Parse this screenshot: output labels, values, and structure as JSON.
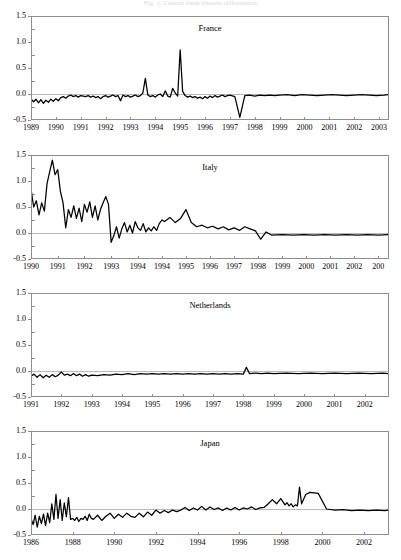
{
  "figure": {
    "caption": "Fig. 1.  Central bank interest differentials",
    "caption_visible": "clipped"
  },
  "chart_data": [
    {
      "type": "line",
      "title": "France",
      "xlabel": "",
      "ylabel": "",
      "ylim": [
        -0.5,
        1.5
      ],
      "yticks": [
        "1.5",
        "1.0",
        "0.5",
        "0.0",
        "-0.5"
      ],
      "ytick_values": [
        1.5,
        1.0,
        0.5,
        0.0,
        -0.5
      ],
      "xlim": [
        1989.0,
        2003.4
      ],
      "xticks": [
        "1989",
        "1990",
        "1991",
        "1992",
        "1993",
        "1994",
        "1995",
        "1996",
        "1997",
        "1998",
        "1999",
        "2000",
        "2001",
        "2002",
        "2003"
      ],
      "xtick_values": [
        1989,
        1990,
        1991,
        1992,
        1993,
        1994,
        1995,
        1996,
        1997,
        1998,
        1999,
        2000,
        2001,
        2002,
        2003
      ],
      "grid": false,
      "legend": "none",
      "zero_reference_line": true,
      "x": [
        1989.0,
        1989.1,
        1989.2,
        1989.3,
        1989.4,
        1989.5,
        1989.6,
        1989.7,
        1989.8,
        1989.9,
        1990.0,
        1990.1,
        1990.2,
        1990.3,
        1990.4,
        1990.5,
        1990.6,
        1990.7,
        1990.8,
        1990.9,
        1991.0,
        1991.1,
        1991.2,
        1991.3,
        1991.4,
        1991.5,
        1991.6,
        1991.7,
        1991.8,
        1991.9,
        1992.0,
        1992.1,
        1992.2,
        1992.3,
        1992.4,
        1992.5,
        1992.6,
        1992.7,
        1992.8,
        1992.9,
        1993.0,
        1993.1,
        1993.2,
        1993.3,
        1993.4,
        1993.5,
        1993.6,
        1993.7,
        1993.8,
        1993.9,
        1994.0,
        1994.1,
        1994.2,
        1994.3,
        1994.4,
        1994.5,
        1994.6,
        1994.7,
        1994.8,
        1994.9,
        1995.0,
        1995.1,
        1995.2,
        1995.3,
        1995.4,
        1995.5,
        1995.6,
        1995.7,
        1995.8,
        1995.9,
        1996.0,
        1996.1,
        1996.2,
        1996.3,
        1996.4,
        1996.5,
        1996.6,
        1996.7,
        1996.8,
        1996.9,
        1997.0,
        1997.2,
        1997.4,
        1997.6,
        1997.8,
        1998.0,
        1998.2,
        1998.4,
        1998.6,
        1998.8,
        1999.0,
        1999.3,
        1999.6,
        1999.9,
        2000.2,
        2000.5,
        2000.8,
        2001.1,
        2001.4,
        2001.7,
        2002.0,
        2002.3,
        2002.6,
        2002.9,
        2003.2,
        2003.4
      ],
      "y": [
        -0.09,
        -0.15,
        -0.1,
        -0.17,
        -0.11,
        -0.18,
        -0.12,
        -0.16,
        -0.1,
        -0.14,
        -0.09,
        -0.13,
        -0.07,
        -0.05,
        -0.08,
        -0.04,
        -0.02,
        -0.05,
        -0.03,
        -0.06,
        -0.03,
        -0.04,
        -0.05,
        -0.03,
        -0.06,
        -0.04,
        -0.07,
        -0.05,
        -0.09,
        -0.05,
        -0.03,
        -0.06,
        -0.04,
        -0.02,
        -0.05,
        -0.03,
        -0.13,
        -0.02,
        -0.05,
        -0.03,
        -0.06,
        -0.04,
        -0.02,
        -0.05,
        -0.03,
        0.02,
        0.3,
        -0.02,
        -0.05,
        -0.03,
        -0.06,
        -0.02,
        0.0,
        -0.05,
        0.06,
        -0.04,
        -0.06,
        0.11,
        0.02,
        -0.04,
        0.85,
        0.05,
        -0.03,
        -0.06,
        -0.04,
        -0.07,
        -0.05,
        -0.08,
        -0.06,
        -0.09,
        -0.05,
        -0.08,
        -0.04,
        -0.07,
        -0.03,
        -0.06,
        -0.04,
        -0.02,
        -0.05,
        -0.03,
        -0.02,
        -0.05,
        -0.45,
        -0.03,
        -0.02,
        -0.04,
        -0.02,
        -0.03,
        -0.02,
        -0.03,
        -0.02,
        -0.01,
        -0.03,
        -0.01,
        -0.02,
        -0.03,
        -0.02,
        -0.01,
        -0.02,
        -0.03,
        -0.02,
        -0.01,
        -0.02,
        -0.03,
        -0.02,
        -0.01,
        -0.02
      ]
    },
    {
      "type": "line",
      "title": "Italy",
      "xlabel": "",
      "ylabel": "",
      "ylim": [
        -0.5,
        1.5
      ],
      "yticks": [
        "1.5",
        "1.0",
        "0.5",
        "0.0",
        "-0.5"
      ],
      "ytick_values": [
        1.5,
        1.0,
        0.5,
        0.0,
        -0.5
      ],
      "xlim": [
        1990.0,
        2003.4
      ],
      "xticks": [
        "1990",
        "1991",
        "1992",
        "1993",
        "1994",
        "1994",
        "1995",
        "1996",
        "1997",
        "1998",
        "1999",
        "2000",
        "2001",
        "2002",
        "200"
      ],
      "xtick_values": [
        1990,
        1991,
        1992,
        1993,
        1994,
        1994.9,
        1995.8,
        1996.7,
        1997.6,
        1998.5,
        1999.4,
        2000.3,
        2001.2,
        2002.1,
        2003.0
      ],
      "grid": false,
      "legend": "none",
      "zero_reference_line": true,
      "x": [
        1990.0,
        1990.1,
        1990.2,
        1990.3,
        1990.4,
        1990.5,
        1990.6,
        1990.7,
        1990.8,
        1990.9,
        1991.0,
        1991.1,
        1991.2,
        1991.3,
        1991.4,
        1991.5,
        1991.6,
        1991.7,
        1991.8,
        1991.9,
        1992.0,
        1992.1,
        1992.2,
        1992.3,
        1992.4,
        1992.5,
        1992.6,
        1992.7,
        1992.8,
        1992.9,
        1993.0,
        1993.1,
        1993.2,
        1993.3,
        1993.4,
        1993.5,
        1993.6,
        1993.7,
        1993.8,
        1993.9,
        1994.0,
        1994.1,
        1994.2,
        1994.3,
        1994.4,
        1994.5,
        1994.6,
        1994.7,
        1994.8,
        1994.9,
        1995.0,
        1995.2,
        1995.4,
        1995.6,
        1995.8,
        1996.0,
        1996.2,
        1996.4,
        1996.6,
        1996.8,
        1997.0,
        1997.2,
        1997.4,
        1997.6,
        1997.8,
        1998.0,
        1998.2,
        1998.4,
        1998.6,
        1998.8,
        1999.0,
        1999.4,
        1999.8,
        2000.2,
        2000.6,
        2001.0,
        2001.4,
        2001.8,
        2002.2,
        2002.6,
        2003.0,
        2003.4
      ],
      "y": [
        0.85,
        0.5,
        0.62,
        0.35,
        0.58,
        0.42,
        0.95,
        1.18,
        1.4,
        1.12,
        1.22,
        0.8,
        0.58,
        0.1,
        0.45,
        0.3,
        0.52,
        0.28,
        0.48,
        0.22,
        0.55,
        0.4,
        0.6,
        0.3,
        0.52,
        0.25,
        0.45,
        0.58,
        0.7,
        0.55,
        -0.18,
        -0.05,
        0.12,
        -0.1,
        0.08,
        0.2,
        0.02,
        0.15,
        0.0,
        0.22,
        0.1,
        0.05,
        0.18,
        0.02,
        0.1,
        0.04,
        0.12,
        0.05,
        0.18,
        0.25,
        0.22,
        0.3,
        0.2,
        0.28,
        0.45,
        0.2,
        0.12,
        0.15,
        0.1,
        0.13,
        0.08,
        0.12,
        0.06,
        0.1,
        0.05,
        0.12,
        0.08,
        0.04,
        -0.12,
        0.02,
        -0.04,
        -0.03,
        -0.04,
        -0.03,
        -0.04,
        -0.03,
        -0.04,
        -0.03,
        -0.04,
        -0.03,
        -0.04,
        -0.03
      ]
    },
    {
      "type": "line",
      "title": "Netherlands",
      "xlabel": "",
      "ylabel": "",
      "ylim": [
        -0.5,
        1.5
      ],
      "yticks": [
        "1.5",
        "1.0",
        "0.5",
        "0.0",
        "-0.5"
      ],
      "ytick_values": [
        1.5,
        1.0,
        0.5,
        0.0,
        -0.5
      ],
      "xlim": [
        1991.0,
        2002.8
      ],
      "xticks": [
        "1991",
        "1992",
        "1993",
        "1994",
        "1995",
        "1996",
        "1997",
        "1998",
        "1999",
        "2000",
        "2001",
        "2002"
      ],
      "xtick_values": [
        1991,
        1992,
        1993,
        1994,
        1995,
        1996,
        1997,
        1998,
        1999,
        2000,
        2001,
        2002
      ],
      "grid": false,
      "legend": "none",
      "zero_reference_line": true,
      "x": [
        1991.0,
        1991.1,
        1991.2,
        1991.3,
        1991.4,
        1991.5,
        1991.6,
        1991.7,
        1991.8,
        1991.9,
        1992.0,
        1992.1,
        1992.2,
        1992.3,
        1992.4,
        1992.5,
        1992.6,
        1992.7,
        1992.8,
        1992.9,
        1993.0,
        1993.2,
        1993.4,
        1993.6,
        1993.8,
        1994.0,
        1994.2,
        1994.4,
        1994.6,
        1994.8,
        1995.0,
        1995.2,
        1995.4,
        1995.6,
        1995.8,
        1996.0,
        1996.2,
        1996.4,
        1996.6,
        1996.8,
        1997.0,
        1997.2,
        1997.4,
        1997.6,
        1997.8,
        1998.0,
        1998.1,
        1998.2,
        1998.4,
        1998.6,
        1998.8,
        1999.0,
        1999.4,
        1999.8,
        2000.2,
        2000.6,
        2001.0,
        2001.4,
        2001.8,
        2002.2,
        2002.6,
        2002.8
      ],
      "y": [
        -0.1,
        -0.06,
        -0.12,
        -0.07,
        -0.13,
        -0.08,
        -0.12,
        -0.07,
        -0.11,
        -0.08,
        -0.02,
        -0.08,
        -0.06,
        -0.09,
        -0.05,
        -0.09,
        -0.06,
        -0.1,
        -0.07,
        -0.1,
        -0.08,
        -0.09,
        -0.07,
        -0.08,
        -0.06,
        -0.07,
        -0.05,
        -0.07,
        -0.05,
        -0.06,
        -0.05,
        -0.06,
        -0.05,
        -0.06,
        -0.05,
        -0.06,
        -0.05,
        -0.06,
        -0.05,
        -0.06,
        -0.05,
        -0.06,
        -0.05,
        -0.06,
        -0.05,
        -0.06,
        0.07,
        -0.05,
        -0.04,
        -0.05,
        -0.04,
        -0.05,
        -0.04,
        -0.05,
        -0.04,
        -0.05,
        -0.04,
        -0.05,
        -0.04,
        -0.05,
        -0.04,
        -0.05
      ]
    },
    {
      "type": "line",
      "title": "Japan",
      "xlabel": "",
      "ylabel": "",
      "ylim": [
        -0.5,
        1.5
      ],
      "yticks": [
        "1.5",
        "1.0",
        "0.5",
        "0.0",
        "-0.5"
      ],
      "ytick_values": [
        1.5,
        1.0,
        0.5,
        0.0,
        -0.5
      ],
      "xlim": [
        1986.0,
        2003.2
      ],
      "xticks": [
        "1986",
        "1988",
        "1990",
        "1992",
        "1994",
        "1996",
        "1998",
        "2000",
        "2002"
      ],
      "xtick_values": [
        1986,
        1988,
        1990,
        1992,
        1994,
        1996,
        1998,
        2000,
        2002
      ],
      "grid": false,
      "legend": "none",
      "zero_reference_line": true,
      "x": [
        1986.0,
        1986.1,
        1986.2,
        1986.3,
        1986.4,
        1986.5,
        1986.6,
        1986.7,
        1986.8,
        1986.9,
        1987.0,
        1987.1,
        1987.2,
        1987.3,
        1987.4,
        1987.5,
        1987.6,
        1987.7,
        1987.8,
        1987.9,
        1988.0,
        1988.1,
        1988.2,
        1988.3,
        1988.4,
        1988.5,
        1988.6,
        1988.7,
        1988.8,
        1988.9,
        1989.0,
        1989.2,
        1989.4,
        1989.6,
        1989.8,
        1990.0,
        1990.2,
        1990.4,
        1990.6,
        1990.8,
        1991.0,
        1991.2,
        1991.4,
        1991.6,
        1991.8,
        1992.0,
        1992.2,
        1992.4,
        1992.6,
        1992.8,
        1993.0,
        1993.2,
        1993.4,
        1993.6,
        1993.8,
        1994.0,
        1994.2,
        1994.4,
        1994.6,
        1994.8,
        1995.0,
        1995.2,
        1995.4,
        1995.6,
        1995.8,
        1996.0,
        1996.2,
        1996.4,
        1996.6,
        1996.8,
        1997.0,
        1997.2,
        1997.4,
        1997.6,
        1997.8,
        1998.0,
        1998.1,
        1998.2,
        1998.3,
        1998.4,
        1998.5,
        1998.6,
        1998.7,
        1998.8,
        1998.9,
        1999.0,
        1999.2,
        1999.4,
        1999.8,
        2000.2,
        2000.6,
        2001.0,
        2001.4,
        2001.8,
        2002.2,
        2002.6,
        2003.0,
        2003.2
      ],
      "y": [
        -0.18,
        -0.3,
        -0.12,
        -0.35,
        -0.14,
        -0.28,
        -0.1,
        -0.32,
        -0.08,
        -0.26,
        0.1,
        -0.2,
        0.28,
        -0.18,
        0.18,
        -0.22,
        0.12,
        -0.15,
        0.22,
        -0.2,
        -0.18,
        -0.22,
        -0.16,
        -0.24,
        -0.18,
        -0.2,
        -0.14,
        -0.22,
        -0.1,
        -0.18,
        -0.2,
        -0.12,
        -0.22,
        -0.14,
        -0.08,
        -0.18,
        -0.1,
        -0.16,
        -0.08,
        -0.14,
        -0.16,
        -0.08,
        -0.15,
        -0.06,
        -0.12,
        -0.02,
        -0.08,
        -0.03,
        -0.07,
        -0.02,
        -0.05,
        -0.02,
        0.03,
        -0.03,
        0.02,
        -0.02,
        0.05,
        -0.02,
        0.04,
        -0.01,
        0.02,
        -0.03,
        0.02,
        -0.02,
        0.03,
        -0.02,
        0.02,
        0.0,
        0.04,
        -0.01,
        0.02,
        0.03,
        0.1,
        0.18,
        0.1,
        0.2,
        0.14,
        0.08,
        0.12,
        0.06,
        0.1,
        0.04,
        0.08,
        0.06,
        0.42,
        0.1,
        0.28,
        0.32,
        0.3,
        0.0,
        -0.02,
        -0.01,
        -0.03,
        -0.02,
        -0.03,
        -0.02,
        -0.03,
        -0.02,
        -0.03
      ]
    }
  ]
}
